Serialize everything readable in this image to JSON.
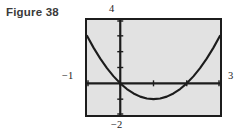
{
  "figure": {
    "caption": "Figure 38"
  },
  "window_labels": {
    "y_max": "4",
    "x_min": "−1",
    "x_max": "3",
    "y_min": "−2"
  },
  "colors": {
    "screen_background": "#e2e2e2",
    "frame": "#1c1c1c",
    "curve": "#1c1c1c",
    "axis": "#1c1c1c",
    "caption_text": "#3a3a3a"
  },
  "chart_data": {
    "type": "line",
    "title": "Figure 38",
    "xlabel": "",
    "ylabel": "",
    "xlim": [
      -1,
      3
    ],
    "ylim": [
      -2,
      4
    ],
    "grid": false,
    "legend": null,
    "axis_tick_spacing": {
      "x": 1,
      "y": 1
    },
    "x_ticks": [
      -1,
      0,
      1,
      2,
      3
    ],
    "y_ticks": [
      -2,
      -1,
      0,
      1,
      2,
      3,
      4
    ],
    "annotations": [
      {
        "text": "4",
        "position": "top-of-y-axis"
      },
      {
        "text": "−1",
        "position": "left-of-x-axis"
      },
      {
        "text": "3",
        "position": "right-of-x-axis"
      },
      {
        "text": "−2",
        "position": "bottom-of-y-axis"
      }
    ],
    "series": [
      {
        "name": "parabola",
        "equation": "y = x^2 - 2x",
        "vertex": [
          1,
          -1
        ],
        "roots": [
          0,
          2
        ],
        "x": [
          -1,
          -0.8,
          -0.6,
          -0.4,
          -0.2,
          0,
          0.2,
          0.4,
          0.6,
          0.8,
          1,
          1.2,
          1.4,
          1.6,
          1.8,
          2,
          2.2,
          2.4,
          2.6,
          2.8,
          3
        ],
        "values": [
          3,
          2.24,
          1.56,
          0.96,
          0.44,
          0,
          -0.36,
          -0.64,
          -0.84,
          -0.96,
          -1,
          -0.96,
          -0.84,
          -0.64,
          -0.36,
          0,
          0.44,
          0.96,
          1.56,
          2.24,
          3
        ]
      }
    ]
  }
}
